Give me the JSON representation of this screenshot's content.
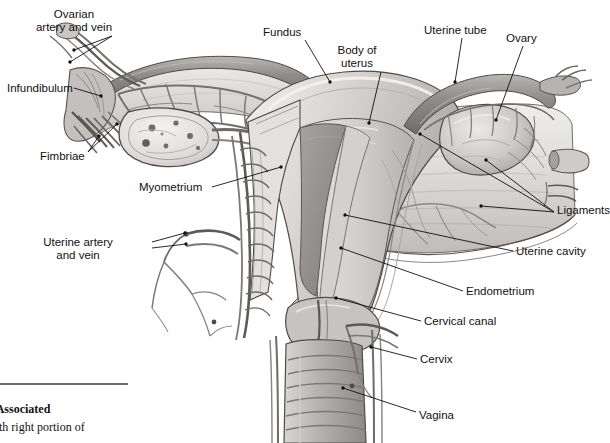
{
  "figure": {
    "type": "anatomical-illustration",
    "style": "grayscale pencil/airbrush medical illustration",
    "palette": {
      "background": "#ffffff",
      "tissue_light": "#e6e4e2",
      "tissue_mid": "#bdbab7",
      "tissue_dark": "#8e8b88",
      "cavity_shadow": "#9a9693",
      "vessel": "#6f6c69",
      "outline": "#3f3d3b",
      "leader_line": "#111111",
      "caption_rule": "#6d6d6d"
    }
  },
  "labels": [
    {
      "id": "ovarian-artery-and-vein",
      "text": "Ovarian\nartery and vein",
      "x": 74,
      "y": 8,
      "align": "center",
      "leaders": [
        {
          "x1": 112,
          "y1": 36,
          "x2": 74,
          "y2": 50
        },
        {
          "x1": 112,
          "y1": 36,
          "x2": 70,
          "y2": 62
        }
      ]
    },
    {
      "id": "fundus",
      "text": "Fundus",
      "x": 263,
      "y": 26,
      "align": "left",
      "leaders": [
        {
          "x1": 305,
          "y1": 40,
          "x2": 330,
          "y2": 82
        }
      ]
    },
    {
      "id": "body-of-uterus",
      "text": "Body of\nuterus",
      "x": 357,
      "y": 44,
      "align": "center",
      "leaders": [
        {
          "x1": 381,
          "y1": 72,
          "x2": 369,
          "y2": 123
        }
      ]
    },
    {
      "id": "uterine-tube",
      "text": "Uterine tube",
      "x": 424,
      "y": 24,
      "align": "left",
      "leaders": [
        {
          "x1": 462,
          "y1": 38,
          "x2": 455,
          "y2": 82
        }
      ]
    },
    {
      "id": "ovary",
      "text": "Ovary",
      "x": 506,
      "y": 32,
      "align": "left",
      "leaders": [
        {
          "x1": 523,
          "y1": 46,
          "x2": 496,
          "y2": 120
        }
      ]
    },
    {
      "id": "infundibulum",
      "text": "Infundibulum",
      "x": 7,
      "y": 82,
      "align": "left",
      "leaders": [
        {
          "x1": 74,
          "y1": 88,
          "x2": 101,
          "y2": 96
        }
      ]
    },
    {
      "id": "fimbriae",
      "text": "Fimbriae",
      "x": 40,
      "y": 150,
      "align": "left",
      "leaders": [
        {
          "x1": 88,
          "y1": 152,
          "x2": 99,
          "y2": 136
        },
        {
          "x1": 88,
          "y1": 152,
          "x2": 117,
          "y2": 124
        }
      ]
    },
    {
      "id": "myometrium",
      "text": "Myometrium",
      "x": 139,
      "y": 181,
      "align": "left",
      "leaders": [
        {
          "x1": 212,
          "y1": 187,
          "x2": 281,
          "y2": 167
        }
      ]
    },
    {
      "id": "uterine-artery-and-vein",
      "text": "Uterine artery\nand vein",
      "x": 78,
      "y": 236,
      "align": "center",
      "leaders": [
        {
          "x1": 152,
          "y1": 242,
          "x2": 185,
          "y2": 233
        },
        {
          "x1": 152,
          "y1": 248,
          "x2": 186,
          "y2": 244
        }
      ]
    },
    {
      "id": "ligaments",
      "text": "Ligaments",
      "x": 557,
      "y": 204,
      "align": "left",
      "leaders": [
        {
          "x1": 554,
          "y1": 212,
          "x2": 486,
          "y2": 160
        },
        {
          "x1": 554,
          "y1": 212,
          "x2": 481,
          "y2": 206
        },
        {
          "x1": 554,
          "y1": 212,
          "x2": 420,
          "y2": 134
        }
      ]
    },
    {
      "id": "uterine-cavity",
      "text": "Uterine cavity",
      "x": 516,
      "y": 245,
      "align": "left",
      "leaders": [
        {
          "x1": 513,
          "y1": 251,
          "x2": 345,
          "y2": 215
        }
      ]
    },
    {
      "id": "endometrium",
      "text": "Endometrium",
      "x": 466,
      "y": 285,
      "align": "left",
      "leaders": [
        {
          "x1": 463,
          "y1": 291,
          "x2": 341,
          "y2": 248
        }
      ]
    },
    {
      "id": "cervical-canal",
      "text": "Cervical canal",
      "x": 424,
      "y": 315,
      "align": "left",
      "leaders": [
        {
          "x1": 421,
          "y1": 321,
          "x2": 336,
          "y2": 298
        }
      ]
    },
    {
      "id": "cervix",
      "text": "Cervix",
      "x": 420,
      "y": 353,
      "align": "left",
      "leaders": [
        {
          "x1": 417,
          "y1": 359,
          "x2": 371,
          "y2": 347
        }
      ]
    },
    {
      "id": "vagina",
      "text": "Vagina",
      "x": 419,
      "y": 409,
      "align": "left",
      "leaders": [
        {
          "x1": 416,
          "y1": 412,
          "x2": 343,
          "y2": 388
        }
      ]
    }
  ],
  "caption": {
    "number_line": "20-8",
    "title_line": "and Associated",
    "body_line": "ew with right portion of"
  }
}
